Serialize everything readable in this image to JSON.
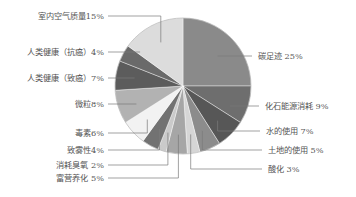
{
  "chart_data": {
    "type": "pie",
    "title": "",
    "start_angle": "12 o'clock",
    "direction": "clockwise",
    "unit": "%",
    "slices": [
      {
        "label": "碳足迹",
        "value": 25,
        "display": "碳足迹 25%",
        "color": "#8a8a8a",
        "label_side": "right"
      },
      {
        "label": "化石能源消耗",
        "value": 9,
        "display": "化石能源消耗 9%",
        "color": "#6e6e6e",
        "label_side": "right"
      },
      {
        "label": "水的使用",
        "value": 7,
        "display": "水的使用 7%",
        "color": "#575757",
        "label_side": "right"
      },
      {
        "label": "土地的使用",
        "value": 5,
        "display": "土地的使用 5%",
        "color": "#8c8c8c",
        "label_side": "right"
      },
      {
        "label": "酸化",
        "value": 3,
        "display": "酸化 3%",
        "color": "#d6d6d6",
        "label_side": "right"
      },
      {
        "label": "富营养化",
        "value": 5,
        "display": "富营养化 5%",
        "color": "#a6a6a6",
        "label_side": "left"
      },
      {
        "label": "消耗臭氧",
        "value": 2,
        "display": "消耗臭氧 2%",
        "color": "#cacaca",
        "label_side": "left"
      },
      {
        "label": "致雾性",
        "value": 4,
        "display": "致雾性4%",
        "color": "#727272",
        "label_side": "left"
      },
      {
        "label": "毒素",
        "value": 6,
        "display": "毒素6%",
        "color": "#f2f2f2",
        "label_side": "left"
      },
      {
        "label": "微粒",
        "value": 8,
        "display": "微粒8%",
        "color": "#b2b2b2",
        "label_side": "left"
      },
      {
        "label": "人类健康（致癌）",
        "value": 7,
        "display": "人类健康（致癌）7%",
        "color": "#5c5c5c",
        "label_side": "left"
      },
      {
        "label": "人类健康（抗癌）",
        "value": 4,
        "display": "人类健康（抗癌）4%",
        "color": "#6a6a6a",
        "label_side": "left"
      },
      {
        "label": "室内空气质量",
        "value": 15,
        "display": "室内空气质量15%",
        "color": "#dcdcdc",
        "label_side": "left"
      }
    ],
    "legend": "none",
    "label_style": "leader-lines"
  }
}
